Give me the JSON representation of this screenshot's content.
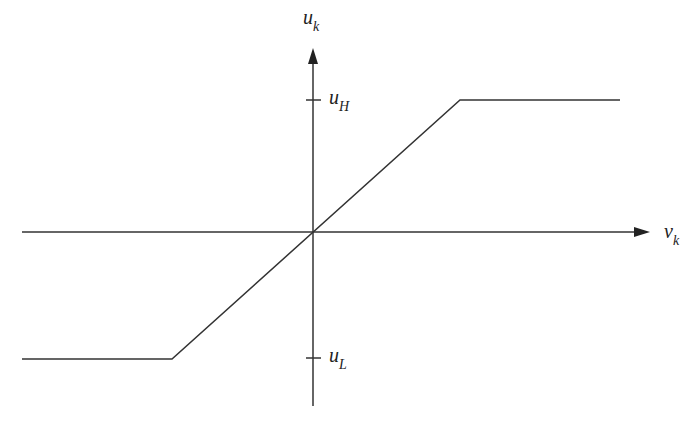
{
  "diagram": {
    "type": "saturation-function",
    "axes": {
      "x_label": "v",
      "x_label_sub": "k",
      "y_label": "u",
      "y_label_sub": "k"
    },
    "ticks": {
      "upper": {
        "label": "u",
        "sub": "H"
      },
      "lower": {
        "label": "u",
        "sub": "L"
      }
    },
    "curve": {
      "segments": [
        "lower saturation (u_L)",
        "linear through origin",
        "upper saturation (u_H)"
      ]
    },
    "colors": {
      "line": "#333333",
      "background": "#ffffff"
    }
  }
}
